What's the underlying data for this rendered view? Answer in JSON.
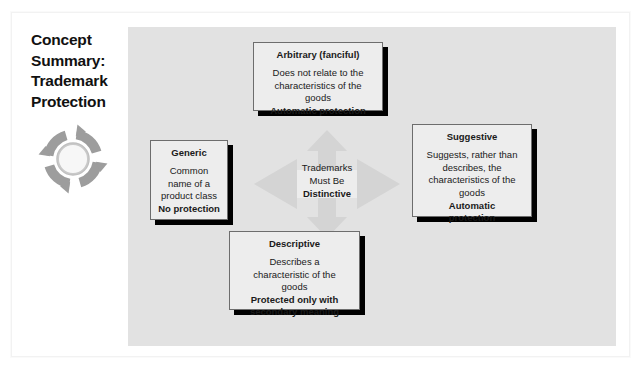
{
  "slide": {
    "title": "Concept Summary: Trademark Protection",
    "icon": "circular-arrows-cycle-icon"
  },
  "center": {
    "line1": "Trademarks",
    "line2": "Must Be",
    "emphasis": "Distinctive",
    "icon": "four-way-arrow-icon"
  },
  "boxes": [
    {
      "id": "arbitrary",
      "heading": "Arbitrary (fanciful)",
      "body": "Does not relate to the\ncharacteristics of the\ngoods",
      "note": "Automatic protection"
    },
    {
      "id": "generic",
      "heading": "Generic",
      "body": "Common\nname of a\nproduct class",
      "note": "No protection"
    },
    {
      "id": "suggestive",
      "heading": "Suggestive",
      "body": "Suggests, rather than\ndescribes, the\ncharacteristics of the\ngoods",
      "note": "Automatic\nprotection"
    },
    {
      "id": "descriptive",
      "heading": "Descriptive",
      "body": "Describes a\ncharacteristic of the\ngoods",
      "note": "Protected only with\nsecondary meaning"
    }
  ],
  "colors": {
    "panel_background": "#e2e2e2",
    "box_background": "#ededed",
    "box_border": "#6d6d6d",
    "box_shadow": "#000000",
    "arrow_fill": "#d2d2d2",
    "icon_fill": "#9a9a9a",
    "text": "#1a1a1a",
    "page_background": "#ffffff"
  }
}
